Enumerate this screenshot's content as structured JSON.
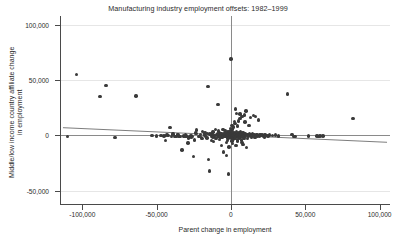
{
  "chart_data": {
    "type": "scatter",
    "title": "Manufacturing industry employment offsets: 1982–1999",
    "xlabel": "Parent change in employment",
    "ylabel_line1": "Middle/low income country affiliate change",
    "ylabel_line2": "in employment",
    "xlim": [
      -115000,
      107000
    ],
    "ylim": [
      -62000,
      108000
    ],
    "xticks": [
      -100000,
      -50000,
      0,
      50000,
      100000
    ],
    "xticklabels": [
      "-100,000",
      "-50,000",
      "0",
      "50,000",
      "100,000"
    ],
    "yticks": [
      -50000,
      0,
      50000,
      100000
    ],
    "yticklabels": [
      "-50,000",
      "0",
      "50,000",
      "100,000"
    ],
    "grid": "horizontal",
    "legend": "none",
    "marker_color": "#3a3a3a",
    "reference_lines": [
      {
        "name": "zero-vertical",
        "type": "vertical",
        "x": 0,
        "color": "#8a8a8a"
      },
      {
        "name": "zero-horizontal",
        "type": "horizontal",
        "y": 0,
        "color": "#8a8a8a"
      }
    ],
    "fit_line": {
      "name": "linear-fit",
      "color": "#6e6e6e",
      "x_start": -113000,
      "y_start": 7000,
      "x_end": 105000,
      "y_end": -6200
    },
    "points": [
      [
        -110000,
        -1200
      ],
      [
        -104000,
        55000
      ],
      [
        -84000,
        45000
      ],
      [
        -88000,
        35000
      ],
      [
        -78000,
        -2000
      ],
      [
        -64000,
        35500
      ],
      [
        -53000,
        200
      ],
      [
        -50000,
        -400
      ],
      [
        -47000,
        -300
      ],
      [
        -45000,
        -500
      ],
      [
        -44000,
        -4800
      ],
      [
        -41000,
        7000
      ],
      [
        -40000,
        -700
      ],
      [
        -39000,
        1400
      ],
      [
        -38000,
        -1000
      ],
      [
        -37000,
        -1200
      ],
      [
        -36000,
        500
      ],
      [
        -35000,
        -800
      ],
      [
        -34000,
        -1100
      ],
      [
        -33000,
        -13000
      ],
      [
        -32000,
        -600
      ],
      [
        -31000,
        -900
      ],
      [
        -30000,
        -400
      ],
      [
        -29000,
        -7000
      ],
      [
        -28000,
        -1500
      ],
      [
        -27000,
        -200
      ],
      [
        -26000,
        -700
      ],
      [
        -25000,
        -19000
      ],
      [
        -24000,
        2800
      ],
      [
        -23000,
        4800
      ],
      [
        -22000,
        -800
      ],
      [
        -21000,
        -1000
      ],
      [
        -20000,
        -1600
      ],
      [
        -19000,
        3800
      ],
      [
        -18000,
        400
      ],
      [
        -17000,
        -600
      ],
      [
        -16000,
        -2200
      ],
      [
        -15500,
        44000
      ],
      [
        -15000,
        -22000
      ],
      [
        -14500,
        -32000
      ],
      [
        -14000,
        1200
      ],
      [
        -13500,
        800
      ],
      [
        -13000,
        -900
      ],
      [
        -12500,
        1800
      ],
      [
        -12000,
        -1400
      ],
      [
        -11500,
        200
      ],
      [
        -11000,
        -700
      ],
      [
        -10500,
        5200
      ],
      [
        -10000,
        -2600
      ],
      [
        -9500,
        600
      ],
      [
        -9000,
        -1100
      ],
      [
        -8800,
        28000
      ],
      [
        -8500,
        900
      ],
      [
        -8000,
        -800
      ],
      [
        -7800,
        2400
      ],
      [
        -7500,
        -1300
      ],
      [
        -7200,
        300
      ],
      [
        -7000,
        -400
      ],
      [
        -6800,
        1600
      ],
      [
        -6500,
        -9000
      ],
      [
        -6200,
        700
      ],
      [
        -6000,
        -1800
      ],
      [
        -5800,
        200
      ],
      [
        -5500,
        1100
      ],
      [
        -5200,
        -600
      ],
      [
        -5000,
        -15000
      ],
      [
        -4800,
        1400
      ],
      [
        -4500,
        -300
      ],
      [
        -4200,
        900
      ],
      [
        -4000,
        -1200
      ],
      [
        -3800,
        2200
      ],
      [
        -3500,
        -500
      ],
      [
        -3200,
        600
      ],
      [
        -3000,
        -18000
      ],
      [
        -2800,
        1800
      ],
      [
        -2600,
        -900
      ],
      [
        -2400,
        400
      ],
      [
        -2200,
        -1400
      ],
      [
        -2000,
        1200
      ],
      [
        -1900,
        3200
      ],
      [
        -1800,
        -600
      ],
      [
        -1700,
        800
      ],
      [
        -1600,
        -35000
      ],
      [
        -1500,
        2600
      ],
      [
        -1400,
        -1100
      ],
      [
        -1300,
        500
      ],
      [
        -1200,
        1600
      ],
      [
        -1100,
        -700
      ],
      [
        -1000,
        3800
      ],
      [
        -900,
        -400
      ],
      [
        -800,
        1000
      ],
      [
        -700,
        -1300
      ],
      [
        -600,
        2000
      ],
      [
        -500,
        -200
      ],
      [
        -400,
        6200
      ],
      [
        -300,
        700
      ],
      [
        -200,
        -900
      ],
      [
        -150,
        1400
      ],
      [
        -100,
        4200
      ],
      [
        -50,
        -500
      ],
      [
        0,
        69000
      ],
      [
        100,
        800
      ],
      [
        200,
        -1200
      ],
      [
        300,
        2400
      ],
      [
        400,
        500
      ],
      [
        500,
        -600
      ],
      [
        600,
        9000
      ],
      [
        700,
        1300
      ],
      [
        800,
        -300
      ],
      [
        900,
        3000
      ],
      [
        1000,
        -1000
      ],
      [
        1100,
        600
      ],
      [
        1200,
        5800
      ],
      [
        1300,
        -700
      ],
      [
        1400,
        1800
      ],
      [
        1500,
        200
      ],
      [
        1600,
        -1400
      ],
      [
        1800,
        7800
      ],
      [
        2000,
        400
      ],
      [
        2200,
        -800
      ],
      [
        2400,
        2600
      ],
      [
        2600,
        11000
      ],
      [
        2800,
        -500
      ],
      [
        3000,
        1200
      ],
      [
        3200,
        24000
      ],
      [
        3400,
        -1100
      ],
      [
        3600,
        3400
      ],
      [
        3800,
        700
      ],
      [
        4000,
        -600
      ],
      [
        4200,
        8600
      ],
      [
        4400,
        1600
      ],
      [
        4600,
        -900
      ],
      [
        4800,
        400
      ],
      [
        5000,
        13000
      ],
      [
        5200,
        -1300
      ],
      [
        5400,
        2200
      ],
      [
        5600,
        800
      ],
      [
        5800,
        -400
      ],
      [
        6000,
        15500
      ],
      [
        6200,
        1000
      ],
      [
        6400,
        -700
      ],
      [
        6600,
        3600
      ],
      [
        6800,
        500
      ],
      [
        7000,
        -1100
      ],
      [
        7200,
        1400
      ],
      [
        7400,
        17000
      ],
      [
        7600,
        -600
      ],
      [
        7800,
        900
      ],
      [
        8000,
        2800
      ],
      [
        8200,
        -8000
      ],
      [
        8400,
        600
      ],
      [
        8600,
        1200
      ],
      [
        8800,
        -500
      ],
      [
        9000,
        18500
      ],
      [
        9200,
        300
      ],
      [
        9400,
        1800
      ],
      [
        9600,
        -900
      ],
      [
        9800,
        700
      ],
      [
        10000,
        22000
      ],
      [
        10500,
        -11000
      ],
      [
        11000,
        1100
      ],
      [
        11500,
        400
      ],
      [
        12000,
        -600
      ],
      [
        12500,
        2000
      ],
      [
        13000,
        16500
      ],
      [
        13500,
        800
      ],
      [
        14000,
        -400
      ],
      [
        14500,
        1500
      ],
      [
        15000,
        17800
      ],
      [
        15500,
        600
      ],
      [
        16000,
        -700
      ],
      [
        16500,
        17200
      ],
      [
        17000,
        900
      ],
      [
        17500,
        300
      ],
      [
        18000,
        -500
      ],
      [
        18500,
        14000
      ],
      [
        19000,
        700
      ],
      [
        19500,
        -300
      ],
      [
        20000,
        1000
      ],
      [
        21000,
        400
      ],
      [
        22000,
        -600
      ],
      [
        23000,
        800
      ],
      [
        24000,
        200
      ],
      [
        25000,
        -400
      ],
      [
        26000,
        500
      ],
      [
        28000,
        -200
      ],
      [
        30000,
        300
      ],
      [
        32000,
        -500
      ],
      [
        38000,
        37500
      ],
      [
        41000,
        600
      ],
      [
        42000,
        -900
      ],
      [
        43000,
        -1000
      ],
      [
        52000,
        -500
      ],
      [
        58000,
        -400
      ],
      [
        59000,
        -700
      ],
      [
        60000,
        -600
      ],
      [
        62000,
        -500
      ],
      [
        82000,
        15500
      ],
      [
        -43000,
        300
      ],
      [
        -42000,
        -200
      ],
      [
        -35500,
        1000
      ],
      [
        -30500,
        600
      ],
      [
        -26500,
        -1800
      ],
      [
        -20500,
        900
      ],
      [
        -17500,
        2200
      ],
      [
        -9200,
        1200
      ],
      [
        -6600,
        2000
      ],
      [
        -2100,
        -2600
      ],
      [
        -950,
        -2000
      ],
      [
        350,
        -2400
      ],
      [
        1450,
        -3200
      ],
      [
        2750,
        -2800
      ],
      [
        4300,
        -3600
      ],
      [
        5900,
        -2200
      ],
      [
        7100,
        -4000
      ],
      [
        8900,
        -3000
      ],
      [
        11200,
        -2600
      ],
      [
        13800,
        -2000
      ],
      [
        16200,
        -1600
      ],
      [
        19200,
        -1200
      ],
      [
        22500,
        -1400
      ],
      [
        -4100,
        4400
      ],
      [
        -12200,
        3000
      ],
      [
        -15800,
        1600
      ],
      [
        -23500,
        1800
      ],
      [
        2350,
        12500
      ],
      [
        3900,
        20000
      ],
      [
        6100,
        19500
      ],
      [
        9500,
        12000
      ],
      [
        12200,
        9000
      ],
      [
        -5400,
        5600
      ],
      [
        -8200,
        4000
      ],
      [
        -11800,
        -5600
      ],
      [
        -19500,
        -3000
      ],
      [
        -24500,
        -4200
      ],
      [
        -28500,
        -2400
      ],
      [
        -3100,
        -6200
      ],
      [
        1000,
        -7400
      ],
      [
        4600,
        -5000
      ],
      [
        -1200,
        -10500
      ],
      [
        3300,
        -9200
      ],
      [
        7500,
        -6600
      ],
      [
        -13000,
        -4600
      ],
      [
        -7600,
        -3800
      ],
      [
        -2500,
        -4400
      ],
      [
        600,
        -5200
      ]
    ]
  }
}
